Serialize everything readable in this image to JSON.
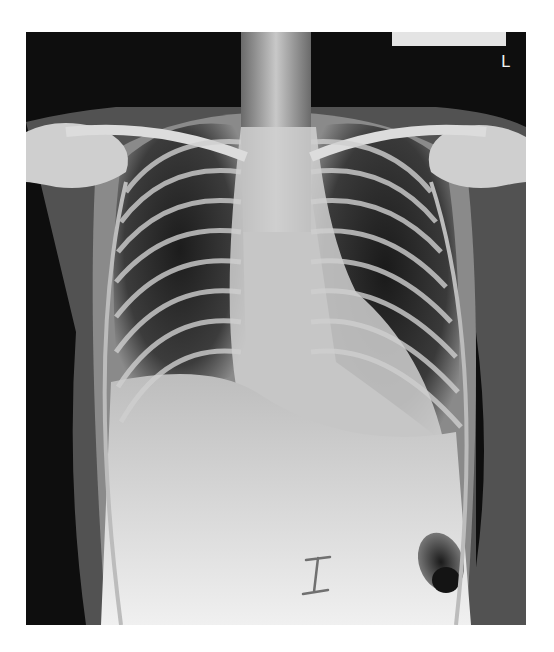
{
  "image": {
    "subject": "Chest X-ray, PA view",
    "side_marker": "L",
    "annotation_mark": "I",
    "colors": {
      "background": "#ffffff",
      "film_dark": "#0e0e0e",
      "bone": "#dcdcdc",
      "soft_tissue": "#9a9a9a",
      "marker_tab": "#e4e4e4"
    }
  }
}
